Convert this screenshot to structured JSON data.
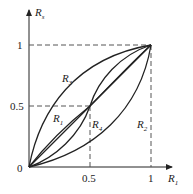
{
  "axes": {
    "x_label": "R",
    "x_label_sub": "1",
    "y_label": "R",
    "y_label_sub": "s",
    "origin_label": "0",
    "x_ticks": [
      "0.5",
      "1"
    ],
    "y_ticks": [
      "0.5",
      "1"
    ]
  },
  "curves": [
    {
      "name": "R1",
      "label": "R",
      "sub": "1",
      "shape": "inverse S through (0.5,0.5): above diagonal below 0.5, below above 0.5"
    },
    {
      "name": "R2",
      "label": "R",
      "sub": "2",
      "shape": "convex, below diagonal from (0,0) to (1,1)"
    },
    {
      "name": "R3",
      "label": "R",
      "sub": "3",
      "shape": "concave, above diagonal from (0,0) to (1,1)"
    },
    {
      "name": "R4",
      "label": "R",
      "sub": "4",
      "shape": "S-curve through (0.5,0.5): below diagonal below 0.5, above above 0.5"
    },
    {
      "name": "diagonal",
      "shape": "straight line from (0,0) to (1,1)"
    }
  ],
  "colors": {
    "line": "#222222",
    "dashed": "#555555"
  }
}
